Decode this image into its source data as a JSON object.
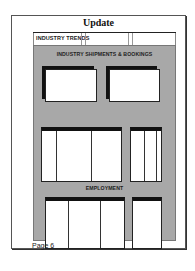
{
  "document": {
    "title": "Update",
    "header_strip": {
      "label": "INDUSTRY TRENDS"
    },
    "sections": [
      {
        "label": "INDUSTRY SHIPMENTS & BOOKINGS"
      },
      {
        "label": "EMPLOYMENT"
      }
    ],
    "footer": {
      "page_label": "Page 6"
    }
  },
  "colors": {
    "panel_gray": "#a8a8a8",
    "frame_black": "#111111",
    "page_white": "#ffffff"
  }
}
